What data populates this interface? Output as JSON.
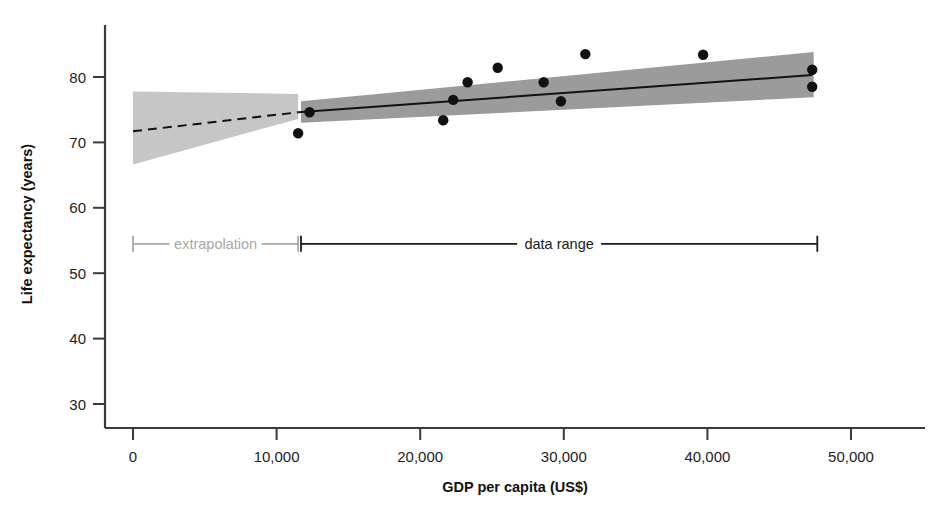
{
  "chart_data": {
    "type": "scatter",
    "title": "",
    "subtitle": "",
    "xlabel": "GDP per capita (US$)",
    "ylabel": "Life expectancy (years)",
    "xlim": [
      0,
      54500
    ],
    "ylim": [
      27.5,
      86.5
    ],
    "grid": false,
    "legend": "none",
    "x_ticks": [
      0,
      10000,
      20000,
      30000,
      40000,
      50000
    ],
    "x_tick_labels": [
      "0",
      "10,000",
      "20,000",
      "30,000",
      "40,000",
      "50,000"
    ],
    "y_ticks": [
      30,
      40,
      50,
      60,
      70,
      80
    ],
    "y_tick_labels": [
      "30",
      "40",
      "50",
      "60",
      "70",
      "80"
    ],
    "points": [
      {
        "x": 11500,
        "y": 71.4
      },
      {
        "x": 12300,
        "y": 74.6
      },
      {
        "x": 21600,
        "y": 73.4
      },
      {
        "x": 22300,
        "y": 76.5
      },
      {
        "x": 23300,
        "y": 79.2
      },
      {
        "x": 25400,
        "y": 81.4
      },
      {
        "x": 28600,
        "y": 79.2
      },
      {
        "x": 29800,
        "y": 76.3
      },
      {
        "x": 31500,
        "y": 83.5
      },
      {
        "x": 39700,
        "y": 83.4
      },
      {
        "x": 47300,
        "y": 81.1
      },
      {
        "x": 47300,
        "y": 78.5
      }
    ],
    "point_color": "#111111",
    "point_radius": 5.2,
    "regression_line": {
      "style": "solid",
      "color": "#111111",
      "x_start": 11500,
      "y_start": 74.6,
      "x_end": 47300,
      "y_end": 80.3
    },
    "extrapolation_line": {
      "style": "dashed",
      "color": "#111111",
      "x_start": 0,
      "y_start": 71.7,
      "x_end": 11500,
      "y_end": 74.6
    },
    "confidence_band_data": {
      "label": "data range",
      "color": "#9b9b9b",
      "x_start": 11700,
      "x_end": 47400,
      "lower_start": 73.0,
      "upper_start": 76.3,
      "lower_end": 76.9,
      "upper_end": 83.8
    },
    "confidence_band_extrapolation": {
      "label": "extrapolation",
      "color": "#c6c6c6",
      "x_start": 0,
      "x_end": 11500,
      "lower_start": 66.6,
      "upper_start": 77.8,
      "lower_end": 73.6,
      "upper_end": 77.4
    },
    "annotations": [
      {
        "name": "extrapolation",
        "label": "extrapolation",
        "color": "#a8a8a8",
        "x_start": 0,
        "x_end": 11500,
        "y": 54.5
      },
      {
        "name": "data-range",
        "label": "data range",
        "color": "#1a1a1a",
        "x_start": 11700,
        "x_end": 47650,
        "y": 54.5
      }
    ]
  },
  "axes": {
    "y_label": "Life expectancy (years)",
    "x_label": "GDP per capita (US$)",
    "y_tick_labels": [
      "80",
      "70",
      "60",
      "50",
      "40",
      "30"
    ],
    "x_tick_labels": [
      "0",
      "10,000",
      "20,000",
      "30,000",
      "40,000",
      "50,000"
    ]
  },
  "annotations": {
    "extrapolation_label": "extrapolation",
    "data_range_label": "data range"
  },
  "colors": {
    "axis": "#3a3a3a",
    "point": "#111111",
    "band_light": "#c6c6c6",
    "band_dark": "#9b9b9b",
    "text_light": "#a8a8a8",
    "text_dark": "#1a1a1a"
  }
}
